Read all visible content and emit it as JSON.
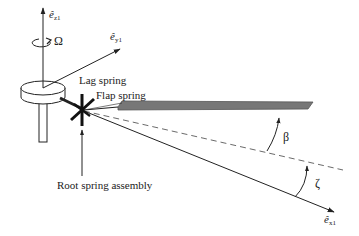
{
  "diagram": {
    "labels": {
      "ez1": {
        "base": "ê",
        "sub": "z1"
      },
      "ey1": {
        "base": "ê",
        "sub": "y1"
      },
      "ex1": {
        "base": "ê",
        "sub": "x1"
      },
      "omega": "Ω",
      "lag_spring": "Lag spring",
      "flap_spring": "Flap spring",
      "root_spring_assembly": "Root spring assembly",
      "beta": "β",
      "zeta": "ζ"
    },
    "colors": {
      "line": "#222222",
      "blade_fill": "#777777",
      "blade_edge": "#555555",
      "spring": "#111111",
      "background": "#ffffff"
    }
  }
}
